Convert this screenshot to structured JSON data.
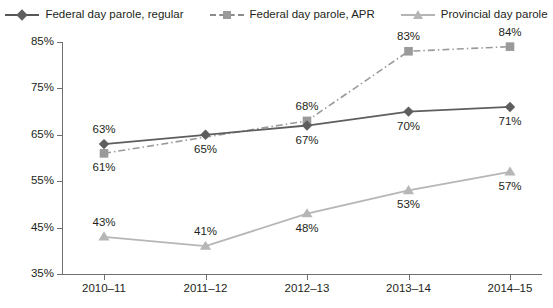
{
  "chart_data": {
    "type": "line",
    "title": "",
    "subtitle": "",
    "xlabel": "",
    "ylabel": "",
    "grid": false,
    "legend_position": "top-center",
    "categories": [
      "2010–11",
      "2011–12",
      "2012–13",
      "2013–14",
      "2014–15"
    ],
    "ylim": [
      35,
      85
    ],
    "yticks": [
      35,
      45,
      55,
      65,
      75,
      85
    ],
    "ytick_labels": [
      "35%",
      "45%",
      "55%",
      "65%",
      "75%",
      "85%"
    ],
    "series": [
      {
        "name": "Federal day parole, regular",
        "marker": "diamond",
        "line_style": "solid",
        "color": "#5e5e5e",
        "values": [
          63,
          65,
          67,
          70,
          71
        ],
        "data_labels": [
          "63%",
          "65%",
          "67%",
          "70%",
          "71%"
        ],
        "label_positions": [
          "above",
          "below",
          "below",
          "below",
          "below"
        ]
      },
      {
        "name": "Federal day parole, APR",
        "marker": "square",
        "line_style": "dash-dot",
        "color": "#9a9a9a",
        "values": [
          61,
          null,
          68,
          83,
          84
        ],
        "data_labels": [
          "61%",
          "",
          "68%",
          "83%",
          "84%"
        ],
        "label_positions": [
          "below",
          "none",
          "above",
          "above",
          "above"
        ]
      },
      {
        "name": "Provincial day parole",
        "marker": "triangle",
        "line_style": "solid",
        "color": "#b6b6b6",
        "values": [
          43,
          41,
          48,
          53,
          57
        ],
        "data_labels": [
          "43%",
          "41%",
          "48%",
          "53%",
          "57%"
        ],
        "label_positions": [
          "above",
          "above",
          "below",
          "below",
          "below"
        ]
      }
    ]
  },
  "legend": {
    "items": [
      {
        "label": "Federal day parole, regular",
        "glyph": "diamond-marker-icon"
      },
      {
        "label": "Federal day parole, APR",
        "glyph": "square-marker-icon"
      },
      {
        "label": "Provincial day parole",
        "glyph": "triangle-marker-icon"
      }
    ]
  },
  "axes": {
    "y_tick_labels": [
      "85%",
      "75%",
      "65%",
      "55%",
      "45%",
      "35%"
    ],
    "x_tick_labels": [
      "2010–11",
      "2011–12",
      "2012–13",
      "2013–14",
      "2014–15"
    ]
  },
  "colors": {
    "federal_regular": "#5e5e5e",
    "federal_apr": "#9a9a9a",
    "provincial": "#b6b6b6",
    "axis": "#6f6f6f",
    "text": "#231f20",
    "background": "#ffffff"
  }
}
